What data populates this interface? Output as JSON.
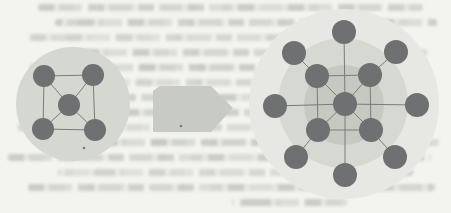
{
  "figure": {
    "type": "network-growth-diagram",
    "colors": {
      "page_bg": "#f3f3ef",
      "node": "#6e7071",
      "edge": "#7a7c76",
      "arrow": "#c8cbc4",
      "speck": "#55584f"
    },
    "small_network": {
      "node_count": 5,
      "halo": {
        "cx": 73,
        "cy": 104,
        "r": 57,
        "fill": "#d5d7d1"
      },
      "node_radius": 11,
      "nodes": [
        {
          "id": "center",
          "x": 69,
          "y": 105
        },
        {
          "id": "top-left",
          "x": 44,
          "y": 76
        },
        {
          "id": "top-right",
          "x": 93,
          "y": 75
        },
        {
          "id": "bottom-left",
          "x": 43,
          "y": 129
        },
        {
          "id": "bottom-right",
          "x": 95,
          "y": 130
        }
      ],
      "edges": [
        [
          "top-left",
          "top-right"
        ],
        [
          "top-right",
          "bottom-right"
        ],
        [
          "bottom-right",
          "bottom-left"
        ],
        [
          "bottom-left",
          "top-left"
        ],
        [
          "center",
          "top-left"
        ],
        [
          "center",
          "top-right"
        ],
        [
          "center",
          "bottom-left"
        ],
        [
          "center",
          "bottom-right"
        ]
      ]
    },
    "arrow": {
      "direction": "right",
      "points": "153,91 160,86 211,86 233,108 211,132 153,132"
    },
    "large_network": {
      "node_count": 13,
      "halos": [
        {
          "cx": 344,
          "cy": 104,
          "r": 95,
          "fill": "#e7e8e3"
        },
        {
          "cx": 343,
          "cy": 103,
          "r": 65,
          "fill": "#d6d8d2"
        },
        {
          "cx": 344,
          "cy": 105,
          "r": 40,
          "fill": "#c6c9c2"
        }
      ],
      "node_radius": 12,
      "nodes": [
        {
          "id": "center",
          "x": 345,
          "y": 104
        },
        {
          "id": "inner-tl",
          "x": 317,
          "y": 76
        },
        {
          "id": "inner-tr",
          "x": 370,
          "y": 75
        },
        {
          "id": "inner-bl",
          "x": 318,
          "y": 130
        },
        {
          "id": "inner-br",
          "x": 371,
          "y": 130
        },
        {
          "id": "outer-n",
          "x": 344,
          "y": 32
        },
        {
          "id": "outer-ne",
          "x": 396,
          "y": 52
        },
        {
          "id": "outer-e",
          "x": 417,
          "y": 105
        },
        {
          "id": "outer-se",
          "x": 395,
          "y": 157
        },
        {
          "id": "outer-s",
          "x": 345,
          "y": 175
        },
        {
          "id": "outer-sw",
          "x": 296,
          "y": 157
        },
        {
          "id": "outer-w",
          "x": 275,
          "y": 106
        },
        {
          "id": "outer-nw",
          "x": 294,
          "y": 53
        }
      ],
      "edges": [
        [
          "inner-tl",
          "inner-tr"
        ],
        [
          "inner-tr",
          "inner-br"
        ],
        [
          "inner-br",
          "inner-bl"
        ],
        [
          "inner-bl",
          "inner-tl"
        ],
        [
          "center",
          "inner-tl"
        ],
        [
          "center",
          "inner-tr"
        ],
        [
          "center",
          "inner-bl"
        ],
        [
          "center",
          "inner-br"
        ],
        [
          "center",
          "outer-n"
        ],
        [
          "center",
          "outer-e"
        ],
        [
          "center",
          "outer-s"
        ],
        [
          "center",
          "outer-w"
        ],
        [
          "outer-nw",
          "inner-tl"
        ],
        [
          "outer-ne",
          "inner-tr"
        ],
        [
          "outer-se",
          "inner-br"
        ],
        [
          "outer-sw",
          "inner-bl"
        ]
      ]
    },
    "specks": [
      {
        "x": 84,
        "y": 148
      },
      {
        "x": 181,
        "y": 126
      }
    ]
  }
}
